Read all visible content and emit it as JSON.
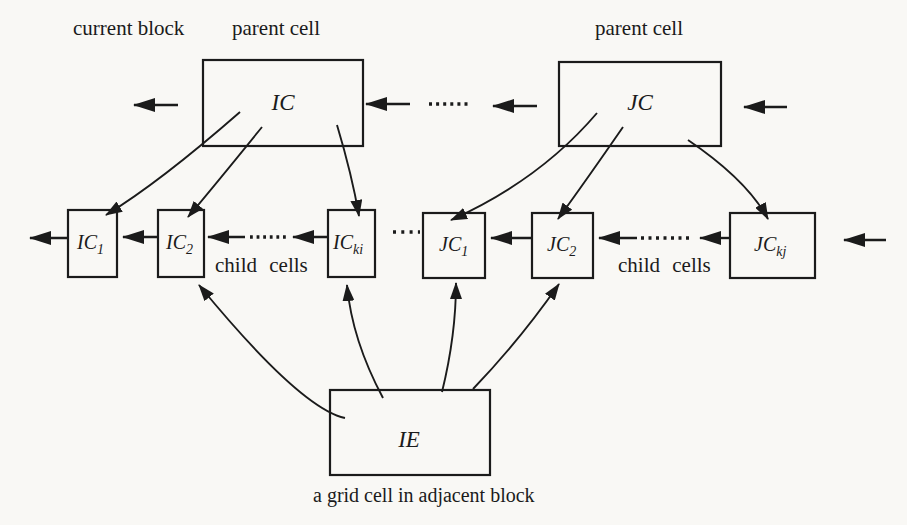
{
  "diagram": {
    "colors": {
      "ink": "#1b1b1b",
      "paper": "#f9f8f5"
    },
    "top_labels": {
      "current_block": "current block",
      "parent_cell_left": "parent cell",
      "parent_cell_right": "parent cell"
    },
    "parent_boxes": {
      "ic": "IC",
      "jc": "JC"
    },
    "child_boxes": {
      "ic1": {
        "main": "IC",
        "sub": "1"
      },
      "ic2": {
        "main": "IC",
        "sub": "2"
      },
      "icki": {
        "main": "IC",
        "sub": "ki"
      },
      "jc1": {
        "main": "JC",
        "sub": "1"
      },
      "jc2": {
        "main": "JC",
        "sub": "2"
      },
      "jckj": {
        "main": "JC",
        "sub": "kj"
      }
    },
    "child_cells_label_left": "child cells",
    "child_cells_label_right": "child cells",
    "ie_box": "IE",
    "ie_caption": "a grid cell in adjacent block"
  }
}
